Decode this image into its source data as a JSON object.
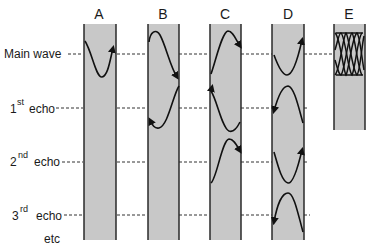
{
  "colors": {
    "tube_fill": "#c8c8c8",
    "tube_border": "#2a2a2a",
    "wave": "#111111",
    "dash": "#333333",
    "background": "#ffffff"
  },
  "columns": [
    {
      "id": "A",
      "label": "A"
    },
    {
      "id": "B",
      "label": "B"
    },
    {
      "id": "C",
      "label": "C"
    },
    {
      "id": "D",
      "label": "D"
    },
    {
      "id": "E",
      "label": "E"
    }
  ],
  "rows": [
    {
      "id": "main",
      "label": "Main wave",
      "sup": "",
      "prefix": ""
    },
    {
      "id": "echo1",
      "prefix": "1",
      "sup": "st",
      "label": "echo"
    },
    {
      "id": "echo2",
      "prefix": "2",
      "sup": "nd",
      "label": "echo"
    },
    {
      "id": "echo3",
      "prefix": "3",
      "sup": "rd",
      "label": "echo"
    }
  ],
  "footer_label": "etc"
}
